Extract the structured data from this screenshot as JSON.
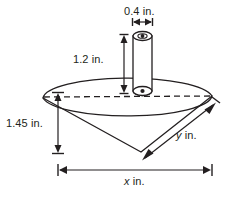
{
  "figure": {
    "stroke_color": "#231f20",
    "fill_color": "#ffffff",
    "background": "#ffffff",
    "labels": {
      "cylinder_diameter": "0.4 in.",
      "cylinder_height": "1.2 in.",
      "cone_height": "1.45 in.",
      "slant_var": "y",
      "slant_unit": " in.",
      "base_var": "x",
      "base_unit": " in."
    },
    "shapes": {
      "cone": "inverted-cone",
      "cylinder": "vertical-cylinder",
      "base_ellipse": "dashed-back-rim"
    }
  }
}
